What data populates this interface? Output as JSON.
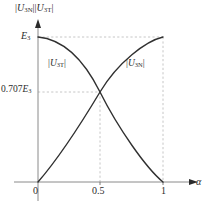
{
  "chart_data": {
    "type": "line",
    "title": "",
    "xlabel": "α",
    "ylabel": "|U3N||U3T|",
    "xlim": [
      0,
      1.12
    ],
    "ylim": [
      0,
      1.12
    ],
    "grid": false,
    "legend_position": "inline-annotation",
    "x_ticks": [
      "0",
      "0.5",
      "1"
    ],
    "x_tick_values": [
      0,
      0.5,
      1
    ],
    "y_ticks": [
      "0.707E3",
      "E3"
    ],
    "y_tick_values": [
      0.707,
      1.0
    ],
    "annotations": [
      {
        "text": "|U3T|",
        "x": 0.22,
        "y": 0.78
      },
      {
        "text": "|U3N|",
        "x": 0.78,
        "y": 0.78
      }
    ],
    "series": [
      {
        "name": "|U3T|",
        "label_html": "|<i>U</i><sub>3T</sub>|",
        "color": "#303030",
        "description": "Falls from E3 at α=0 to 0 at α=1, quarter-ellipse shape",
        "x": [
          0,
          0.1,
          0.2,
          0.3,
          0.4,
          0.5,
          0.6,
          0.7,
          0.8,
          0.9,
          1.0
        ],
        "values": [
          1.0,
          0.995,
          0.98,
          0.954,
          0.917,
          0.707,
          0.8,
          0.714,
          0.6,
          0.436,
          0.0
        ]
      },
      {
        "name": "|U3N|",
        "label_html": "|<i>U</i><sub>3N</sub>|",
        "color": "#303030",
        "description": "Rises from 0 at α=0 to E3 at α=1, crossing at α=0.5",
        "x": [
          0,
          0.1,
          0.2,
          0.3,
          0.4,
          0.5,
          0.6,
          0.7,
          0.8,
          0.9,
          1.0
        ],
        "values": [
          0.0,
          0.14,
          0.28,
          0.42,
          0.56,
          0.707,
          0.84,
          0.92,
          0.965,
          0.99,
          1.0
        ]
      }
    ],
    "intersection": {
      "x": 0.5,
      "y": 0.707,
      "label": "0.707E3"
    },
    "guide_lines": [
      {
        "type": "horizontal",
        "y": 1.0,
        "from_x": 0,
        "to_x": 1.0,
        "style": "dashed"
      },
      {
        "type": "horizontal",
        "y": 0.707,
        "from_x": 0,
        "to_x": 0.5,
        "style": "dashed"
      },
      {
        "type": "vertical",
        "x": 0.5,
        "from_y": 0,
        "to_y": 0.707,
        "style": "dashed"
      },
      {
        "type": "vertical",
        "x": 1.0,
        "from_y": 0,
        "to_y": 1.0,
        "style": "dashed"
      }
    ],
    "colors": {
      "curve": "#303030",
      "axis": "#8a8a8a",
      "guide": "#b5b5b5",
      "text": "#2b2b2b",
      "background": "#ffffff"
    }
  },
  "axes": {
    "y_axis_label_html": "|<i>U</i><sub>3N</sub>||<i>U</i><sub>3T</sub>|",
    "x_axis_label": "α",
    "y_tick_e3_html": "<i>E</i><sub>3</sub>",
    "y_tick_0707_html": "0.707<i>E</i><sub>3</sub>",
    "x_tick_0": "0",
    "x_tick_05": "0.5",
    "x_tick_1": "1"
  },
  "series_labels": {
    "left_html": "|<i>U</i><sub>3T</sub>|",
    "right_html": "|<i>U</i><sub>3N</sub>|"
  }
}
